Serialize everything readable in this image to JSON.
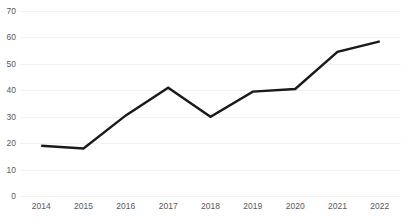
{
  "chart_data": {
    "type": "line",
    "title": "",
    "subtitle": "",
    "xlabel": "",
    "ylabel": "",
    "categories": [
      "2014",
      "2015",
      "2016",
      "2017",
      "2018",
      "2019",
      "2020",
      "2021",
      "2022"
    ],
    "values": [
      19,
      18,
      30.5,
      41,
      30,
      39.5,
      40.5,
      54.5,
      58.5
    ],
    "series": [
      {
        "name": "",
        "values": [
          19,
          18,
          30.5,
          41,
          30,
          39.5,
          40.5,
          54.5,
          58.5
        ]
      }
    ],
    "ylim": [
      0,
      70
    ],
    "y_ticks": [
      0,
      10,
      20,
      30,
      40,
      50,
      60,
      70
    ],
    "y_tick_labels": [
      "0",
      "10",
      "20",
      "30",
      "40",
      "50",
      "60",
      "70"
    ],
    "x_tick_labels": [
      "2014",
      "2015",
      "2016",
      "2017",
      "2018",
      "2019",
      "2020",
      "2021",
      "2022"
    ],
    "grid": true,
    "grid_axis": "y",
    "legend": false,
    "legend_position": "none",
    "markers": false,
    "line_color": "#1a1a1a",
    "grid_color": "#f2f2f2",
    "tick_label_color": "#595959",
    "background_color": "#ffffff"
  }
}
